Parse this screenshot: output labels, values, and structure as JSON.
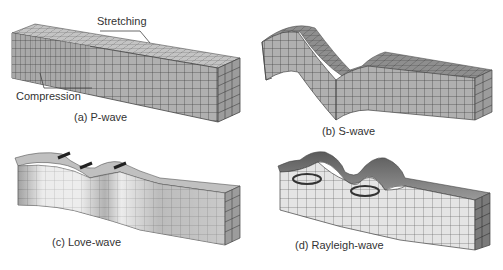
{
  "figure": {
    "panels": [
      {
        "id": "a",
        "caption": "(a) P-wave",
        "annotations": [
          "Stretching",
          "Compression"
        ]
      },
      {
        "id": "b",
        "caption": "(b) S-wave"
      },
      {
        "id": "c",
        "caption": "(c) Love-wave"
      },
      {
        "id": "d",
        "caption": "(d) Rayleigh-wave"
      }
    ]
  },
  "colors": {
    "mesh_face": "#b4b4b4",
    "mesh_top": "#c8c8c8",
    "mesh_side": "#9a9a9a",
    "grid_line": "#3c3c3c",
    "text": "#333333",
    "light_face": "#e8e8e8"
  }
}
